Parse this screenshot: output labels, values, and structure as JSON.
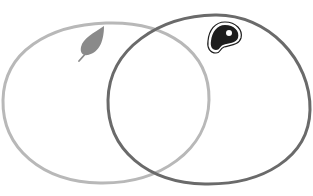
{
  "diagram": {
    "type": "venn",
    "sets": [
      {
        "name": "plant",
        "icon": "leaf-icon",
        "stroke_color": "#b8b8b8",
        "icon_color": "#8a8a8a"
      },
      {
        "name": "meat",
        "icon": "steak-icon",
        "stroke_color": "#6a6a6a",
        "icon_color": "#1e1e1e"
      }
    ],
    "background": "#ffffff"
  }
}
